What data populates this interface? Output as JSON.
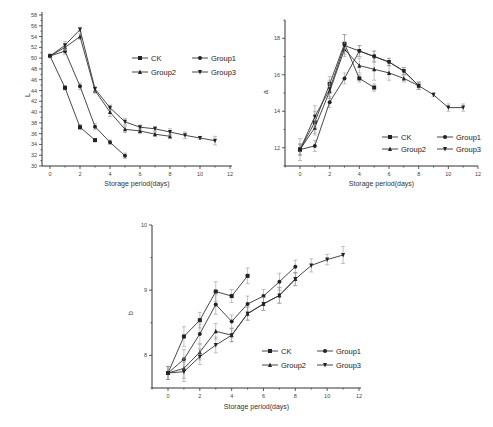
{
  "chart_data": [
    {
      "id": "L",
      "type": "line",
      "title": "",
      "xlabel": "Storage period(days)",
      "ylabel": "L",
      "xlim": [
        -1,
        12
      ],
      "ylim": [
        30,
        58
      ],
      "xticks": [
        0,
        2,
        4,
        6,
        8,
        10,
        12
      ],
      "yticks": [
        30,
        32,
        34,
        36,
        38,
        40,
        42,
        44,
        46,
        48,
        50,
        52,
        54,
        56,
        58
      ],
      "grid": false,
      "legend_position": "upper right",
      "legend": [
        "CK",
        "Group1",
        "Group2",
        "Group3"
      ],
      "series": [
        {
          "name": "CK",
          "marker": "square",
          "x": [
            0,
            1,
            2,
            3
          ],
          "values": [
            50.4,
            44.5,
            37.2,
            34.8
          ],
          "err": [
            0.3,
            0.4,
            0.5,
            0.3
          ]
        },
        {
          "name": "Group1",
          "marker": "circle",
          "x": [
            0,
            1,
            2,
            3,
            4,
            5
          ],
          "values": [
            50.4,
            51.3,
            44.8,
            37.3,
            34.4,
            31.9
          ],
          "err": [
            0.3,
            0.6,
            0.6,
            0.6,
            0.4,
            0.5
          ]
        },
        {
          "name": "Group2",
          "marker": "triangle-up",
          "x": [
            0,
            1,
            2,
            3,
            4,
            5,
            6,
            7,
            8
          ],
          "values": [
            50.4,
            52.0,
            54.0,
            44.0,
            40.0,
            36.8,
            36.5,
            35.9,
            35.5
          ],
          "err": [
            0.3,
            0.6,
            0.5,
            0.5,
            0.8,
            0.6,
            0.5,
            0.4,
            0.4
          ]
        },
        {
          "name": "Group3",
          "marker": "triangle-down",
          "x": [
            0,
            1,
            2,
            3,
            4,
            5,
            6,
            7,
            8,
            9,
            10,
            11
          ],
          "values": [
            50.4,
            52.4,
            55.3,
            44.3,
            40.8,
            38.2,
            37.2,
            36.9,
            36.3,
            35.7,
            35.2,
            34.7
          ],
          "err": [
            0.3,
            0.7,
            0.4,
            0.5,
            0.5,
            0.6,
            0.4,
            0.4,
            0.6,
            0.6,
            0.3,
            0.8
          ]
        }
      ]
    },
    {
      "id": "a",
      "type": "line",
      "title": "",
      "xlabel": "Storage period(days)",
      "ylabel": "a",
      "xlim": [
        -1,
        12
      ],
      "ylim": [
        11,
        19
      ],
      "xticks": [
        0,
        2,
        4,
        6,
        8,
        10,
        12
      ],
      "yticks": [
        12,
        14,
        16,
        18
      ],
      "grid": false,
      "legend_position": "lower right",
      "legend": [
        "CK",
        "Group1",
        "Group2",
        "Group3"
      ],
      "series": [
        {
          "name": "CK",
          "marker": "square",
          "x": [
            0,
            1,
            2,
            3,
            4,
            5
          ],
          "values": [
            11.9,
            13.4,
            15.5,
            17.7,
            15.8,
            15.3
          ],
          "err": [
            0.6,
            0.6,
            0.4,
            0.5,
            0.2,
            0.2
          ]
        },
        {
          "name": "Group1",
          "marker": "circle",
          "x": [
            0,
            1,
            2,
            3,
            4,
            5,
            6,
            7,
            8
          ],
          "values": [
            11.9,
            12.1,
            14.5,
            15.8,
            17.3,
            17.0,
            16.7,
            16.2,
            15.4
          ],
          "err": [
            0.3,
            0.3,
            0.3,
            0.3,
            0.3,
            0.3,
            0.2,
            0.2,
            0.2
          ]
        },
        {
          "name": "Group2",
          "marker": "triangle-up",
          "x": [
            0,
            1,
            2,
            3,
            4,
            5,
            6,
            7,
            8
          ],
          "values": [
            11.9,
            13.1,
            15.1,
            17.4,
            16.5,
            16.3,
            16.1,
            15.8,
            15.4
          ],
          "err": [
            0.3,
            0.4,
            0.4,
            0.3,
            0.4,
            0.6,
            0.4,
            0.2,
            0.2
          ]
        },
        {
          "name": "Group3",
          "marker": "triangle-down",
          "x": [
            0,
            1,
            2,
            3,
            4,
            5,
            6,
            7,
            8,
            9,
            10,
            11
          ],
          "values": [
            11.9,
            13.7,
            15.2,
            17.6,
            17.3,
            17.0,
            16.7,
            16.2,
            15.4,
            14.9,
            14.2,
            14.2
          ],
          "err": [
            0.3,
            0.6,
            0.5,
            0.6,
            0.3,
            0.3,
            0.2,
            0.2,
            0.2,
            0.1,
            0.2,
            0.2
          ]
        }
      ]
    },
    {
      "id": "b",
      "type": "line",
      "title": "",
      "xlabel": "Storage period(days)",
      "ylabel": "b",
      "xlim": [
        -1,
        12
      ],
      "ylim": [
        7.5,
        10
      ],
      "xticks": [
        0,
        2,
        4,
        6,
        8,
        10,
        12
      ],
      "yticks": [
        8,
        9,
        10
      ],
      "grid": false,
      "legend_position": "lower right",
      "legend": [
        "CK",
        "Group1",
        "Group2",
        "Group3"
      ],
      "series": [
        {
          "name": "CK",
          "marker": "square",
          "x": [
            0,
            1,
            2,
            3,
            4,
            5
          ],
          "values": [
            7.73,
            8.29,
            8.54,
            8.98,
            8.91,
            9.22
          ],
          "err": [
            0.1,
            0.15,
            0.12,
            0.15,
            0.1,
            0.12
          ]
        },
        {
          "name": "Group1",
          "marker": "circle",
          "x": [
            0,
            1,
            2,
            3,
            4,
            5,
            6,
            7,
            8
          ],
          "values": [
            7.73,
            7.94,
            8.33,
            8.78,
            8.52,
            8.79,
            8.91,
            9.13,
            9.36
          ],
          "err": [
            0.1,
            0.15,
            0.15,
            0.15,
            0.1,
            0.12,
            0.1,
            0.13,
            0.1
          ]
        },
        {
          "name": "Group2",
          "marker": "triangle-up",
          "x": [
            0,
            1,
            2,
            3,
            4,
            5,
            6,
            7,
            8
          ],
          "values": [
            7.73,
            7.8,
            8.05,
            8.37,
            8.31,
            8.64,
            8.79,
            8.92,
            9.17
          ],
          "err": [
            0.1,
            0.15,
            0.12,
            0.12,
            0.1,
            0.1,
            0.1,
            0.12,
            0.1
          ]
        },
        {
          "name": "Group3",
          "marker": "triangle-down",
          "x": [
            0,
            1,
            2,
            3,
            4,
            5,
            6,
            7,
            8,
            9,
            10,
            11
          ],
          "values": [
            7.73,
            7.75,
            7.98,
            8.16,
            8.31,
            8.64,
            8.79,
            8.92,
            9.17,
            9.38,
            9.47,
            9.54
          ],
          "err": [
            0.1,
            0.15,
            0.12,
            0.12,
            0.1,
            0.1,
            0.1,
            0.12,
            0.1,
            0.1,
            0.08,
            0.13
          ]
        }
      ]
    }
  ]
}
